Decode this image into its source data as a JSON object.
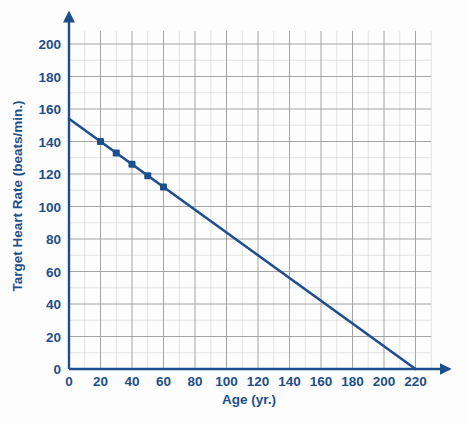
{
  "chart_data": {
    "type": "line",
    "title": "",
    "xlabel": "Age (yr.)",
    "ylabel": "Target Heart Rate (beats/min.)",
    "xlim": [
      0,
      230
    ],
    "ylim": [
      0,
      210
    ],
    "xticks": [
      0,
      20,
      40,
      60,
      80,
      100,
      120,
      140,
      160,
      180,
      200,
      220
    ],
    "yticks": [
      0,
      20,
      40,
      60,
      80,
      100,
      120,
      140,
      160,
      180,
      200
    ],
    "grid": true,
    "grid_step_x": 10,
    "grid_step_y": 10,
    "legend": "none",
    "line": {
      "name": "Target heart rate vs. age",
      "x": [
        0,
        220
      ],
      "y": [
        154,
        0
      ],
      "color": "#1c4f8c",
      "equation": "y = 154 - 0.7x"
    },
    "points": [
      {
        "x": 20,
        "y": 140
      },
      {
        "x": 30,
        "y": 133
      },
      {
        "x": 40,
        "y": 126
      },
      {
        "x": 50,
        "y": 119
      },
      {
        "x": 60,
        "y": 112
      }
    ],
    "marker_color": "#1c4f8c"
  },
  "axes": {
    "x_tick_labels": [
      "0",
      "20",
      "40",
      "60",
      "80",
      "100",
      "120",
      "140",
      "160",
      "180",
      "200",
      "220"
    ],
    "y_tick_labels": [
      "0",
      "20",
      "40",
      "60",
      "80",
      "100",
      "120",
      "140",
      "160",
      "180",
      "200"
    ],
    "x_title": "Age (yr.)",
    "y_title": "Target Heart Rate (beats/min.)"
  },
  "colors": {
    "axis": "#1c4f8c",
    "line": "#1c4f8c",
    "grid_major": "#9a9a9a",
    "grid_minor": "#d3d3d3",
    "background": "#fdfdfd"
  }
}
